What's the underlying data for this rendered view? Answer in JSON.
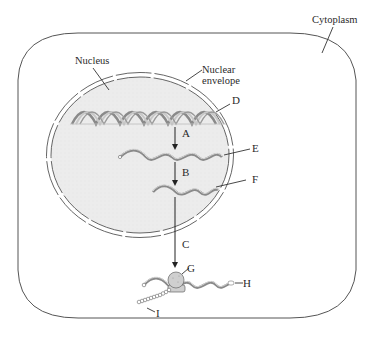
{
  "diagram": {
    "regions": {
      "cytoplasm": "Cytoplasm",
      "nucleus": "Nucleus",
      "nuclear_envelope_line1": "Nuclear",
      "nuclear_envelope_line2": "envelope"
    },
    "structures": {
      "D": "D",
      "E": "E",
      "F": "F",
      "G": "G",
      "H": "H",
      "I": "I"
    },
    "steps": {
      "A": "A",
      "B": "B",
      "C": "C"
    },
    "colors": {
      "nucleoplasm": "#ececec",
      "outline": "#555555",
      "strand_dark": "#8a8a8a",
      "strand_light": "#d6d6d6",
      "text": "#2a2a2a"
    }
  }
}
